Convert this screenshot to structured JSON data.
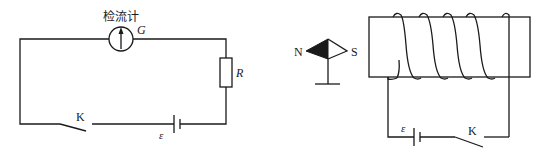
{
  "figure": {
    "left_circuit": {
      "galvanometer_label": "检流计",
      "galvanometer_symbol": "G",
      "resistor_label": "R",
      "switch_label": "K",
      "emf_label": "ε"
    },
    "right_circuit": {
      "compass_north_label": "N",
      "compass_south_label": "S",
      "emf_label": "ε",
      "switch_label": "K",
      "coil_turns": 5
    },
    "colors": {
      "line": "#1a1a1a",
      "background": "#ffffff"
    }
  }
}
